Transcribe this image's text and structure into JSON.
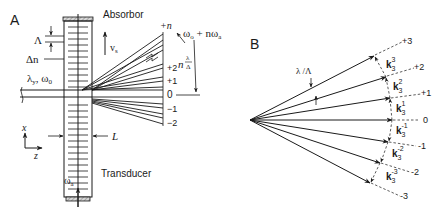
{
  "panelA": {
    "label": "A",
    "absorber_label": "Absorbor",
    "transducer_label": "Transducer",
    "velocity_label": "v",
    "velocity_sub": "s",
    "grating_period_label": "Λ",
    "index_label": "Δn",
    "input_label": "λ",
    "input_sub": "y",
    "input_omega": ", ω",
    "input_omega_sub": "0",
    "thickness_label": "L",
    "axis_x": "x",
    "axis_z": "z",
    "acoustic_freq": "ω",
    "acoustic_freq_sub": "a",
    "output_freq": "ω",
    "output_freq_sub": "o",
    "output_freq_rest": " + nω",
    "output_freq_rest_sub": "a",
    "angle_label_n": "n",
    "angle_label_num": "λ",
    "angle_label_den": "Δ",
    "orders": [
      "+n",
      "+2",
      "+1",
      "0",
      "−1",
      "−2"
    ]
  },
  "panelB": {
    "label": "B",
    "angle_label": "λ /Λ",
    "orders": [
      "+3",
      "+2",
      "+1",
      "0",
      "-1",
      "-2",
      "-3"
    ],
    "vector_label": "k",
    "vector_sub": "3",
    "vector_sups": [
      "3",
      "2",
      "1",
      "-1",
      "-2",
      "-3"
    ]
  },
  "colors": {
    "ink": "#1a1a1a",
    "hatch": "#888888",
    "background": "#ffffff"
  }
}
